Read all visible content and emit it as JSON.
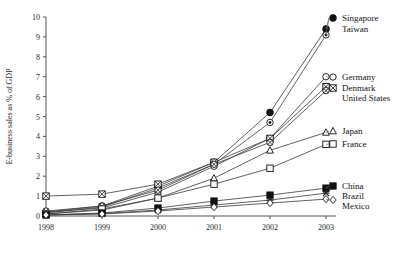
{
  "chart_data": {
    "type": "line",
    "title": "",
    "xlabel": "",
    "ylabel": "E-business sales as % of GDP",
    "x": [
      "1998",
      "1999",
      "2000",
      "2001",
      "2002",
      "2003"
    ],
    "xtick_labels": [
      "1998",
      "1999",
      "2000",
      "2001",
      "2002",
      "2003"
    ],
    "ytick_labels": [
      "0",
      "1",
      "2",
      "3",
      "4",
      "5",
      "6",
      "7",
      "8",
      "9",
      "10"
    ],
    "ylim": [
      0,
      10
    ],
    "grid": false,
    "legend_position": "right-inline",
    "series": [
      {
        "name": "Singapore",
        "marker": "filled-circle",
        "values": [
          0.2,
          0.5,
          1.5,
          2.7,
          5.2,
          9.4
        ]
      },
      {
        "name": "Taiwan",
        "marker": "open-circle-dot",
        "values": [
          0.15,
          0.45,
          1.4,
          2.6,
          4.7,
          9.1
        ]
      },
      {
        "name": "Germany",
        "marker": "open-circle",
        "values": [
          0.2,
          0.4,
          1.2,
          2.5,
          3.9,
          7.0
        ]
      },
      {
        "name": "Denmark",
        "marker": "crossed-square",
        "values": [
          1.0,
          1.1,
          1.6,
          2.7,
          3.9,
          6.5
        ]
      },
      {
        "name": "United States",
        "marker": "crossed-circle",
        "values": [
          0.25,
          0.5,
          1.3,
          2.6,
          3.7,
          6.3
        ]
      },
      {
        "name": "Japan",
        "marker": "open-triangle",
        "values": [
          0.1,
          0.3,
          0.9,
          1.9,
          3.3,
          4.2
        ]
      },
      {
        "name": "France",
        "marker": "open-square",
        "values": [
          0.1,
          0.35,
          0.9,
          1.6,
          2.4,
          3.6
        ]
      },
      {
        "name": "China",
        "marker": "filled-square",
        "values": [
          0.05,
          0.15,
          0.4,
          0.75,
          1.05,
          1.4
        ]
      },
      {
        "name": "Brazil",
        "marker": "cross-x",
        "values": [
          0.05,
          0.12,
          0.3,
          0.55,
          0.8,
          1.15
        ]
      },
      {
        "name": "Mexico",
        "marker": "open-diamond",
        "values": [
          0.05,
          0.1,
          0.25,
          0.45,
          0.65,
          0.85
        ]
      }
    ]
  },
  "legend": {
    "entries": [
      {
        "label": "Singapore",
        "marker": "filled-circle"
      },
      {
        "label": "Taiwan",
        "marker": "open-circle-dot"
      },
      {
        "label": "Germany",
        "marker": "open-circle"
      },
      {
        "label": "Denmark",
        "marker": "crossed-square"
      },
      {
        "label": "United States",
        "marker": "crossed-circle"
      },
      {
        "label": "Japan",
        "marker": "open-triangle"
      },
      {
        "label": "France",
        "marker": "open-square"
      },
      {
        "label": "China",
        "marker": "filled-square"
      },
      {
        "label": "Brazil",
        "marker": "cross-x"
      },
      {
        "label": "Mexico",
        "marker": "open-diamond"
      }
    ]
  },
  "colors": {
    "line": "#3a3a3a",
    "axis": "#555555",
    "text": "#1a1a1a",
    "background": "#ffffff"
  }
}
